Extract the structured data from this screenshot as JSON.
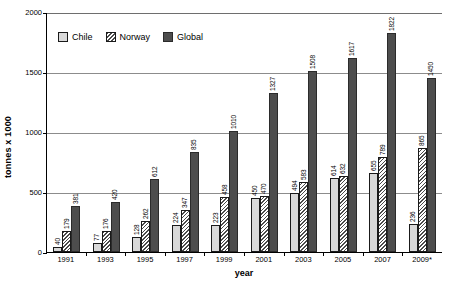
{
  "chart_data": {
    "type": "bar",
    "title": "",
    "xlabel": "year",
    "ylabel": "tonnes x 1000",
    "ylim": [
      0,
      2000
    ],
    "yticks": [
      0,
      500,
      1000,
      1500,
      2000
    ],
    "ytick_labels": [
      "0",
      "500",
      "1000",
      "1500",
      "2000"
    ],
    "grid": true,
    "legend_position": "top-left-inside",
    "categories": [
      "1991",
      "1993",
      "1995",
      "1997",
      "1999",
      "2001",
      "2003",
      "2005",
      "2007",
      "2009*"
    ],
    "series": [
      {
        "name": "Chile",
        "color": "#d9d9d9",
        "pattern": "solid-light",
        "values": [
          40,
          77,
          128,
          224,
          223,
          450,
          494,
          614,
          655,
          236
        ]
      },
      {
        "name": "Norway",
        "color": "#ffffff",
        "pattern": "diagonal-hatch",
        "values": [
          179,
          176,
          262,
          347,
          458,
          470,
          583,
          632,
          789,
          865
        ]
      },
      {
        "name": "Global",
        "color": "#4d4d4d",
        "pattern": "solid-dark",
        "values": [
          381,
          420,
          612,
          835,
          1010,
          1327,
          1508,
          1617,
          1822,
          1450
        ]
      }
    ]
  },
  "legend": {
    "items": [
      {
        "label": "Chile",
        "swatch": "chile"
      },
      {
        "label": "Norway",
        "swatch": "norway"
      },
      {
        "label": "Global",
        "swatch": "global"
      }
    ]
  },
  "axes": {
    "y_title": "tonnes x 1000",
    "x_title": "year"
  }
}
